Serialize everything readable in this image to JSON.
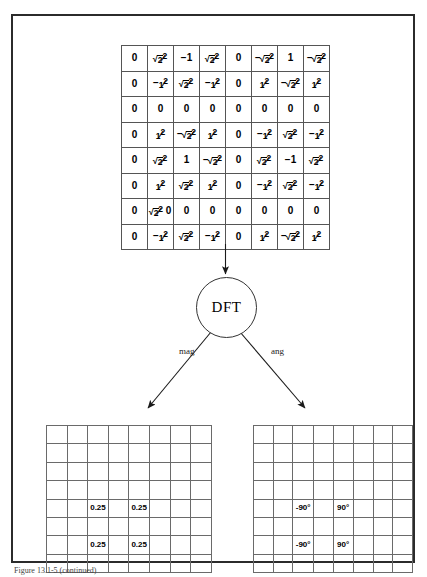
{
  "figure": {
    "caption": "Figure 13.1-5 (continued)",
    "transform_label": "DFT",
    "branch_labels": {
      "magnitude": "mag",
      "angle": "ang"
    }
  },
  "input_matrix": {
    "rows": 8,
    "cols": 8,
    "cells": [
      [
        "0",
        "√2/2",
        "-1",
        "√2/2",
        "0",
        "-√2/2",
        "1",
        "-√2/2"
      ],
      [
        "0",
        "-1/2",
        "√2/2",
        "-1/2",
        "0",
        "1/2",
        "-√2/2",
        "1/2"
      ],
      [
        "0",
        "0",
        "0",
        "0",
        "0",
        "0",
        "0",
        "0"
      ],
      [
        "0",
        "1/2",
        "-√2/2",
        "1/2",
        "0",
        "-1/2",
        "√2/2",
        "-1/2"
      ],
      [
        "0",
        "√2/2",
        "1",
        "-√2/2",
        "0",
        "√2/2",
        "-1",
        "√2/2"
      ],
      [
        "0",
        "1/2",
        "√2/2",
        "1/2",
        "0",
        "-1/2",
        "√2/2",
        "-1/2"
      ],
      [
        "0",
        "√2/2 0",
        "0",
        "0",
        "0",
        "0",
        "0",
        "0"
      ],
      [
        "0",
        "-1/2",
        "√2/2",
        "-1/2",
        "0",
        "1/2",
        "-√2/2",
        "1/2"
      ]
    ]
  },
  "chart_data": {
    "type": "heatmap",
    "grids": [
      {
        "name": "magnitude",
        "label": "mag",
        "rows": 8,
        "cols": 8,
        "values": [
          [
            "",
            "",
            "",
            "",
            "",
            "",
            "",
            ""
          ],
          [
            "",
            "",
            "",
            "",
            "",
            "",
            "",
            ""
          ],
          [
            "",
            "",
            "",
            "",
            "",
            "",
            "",
            ""
          ],
          [
            "",
            "",
            "",
            "",
            "",
            "",
            "",
            ""
          ],
          [
            "",
            "",
            "0.25",
            "",
            "0.25",
            "",
            "",
            ""
          ],
          [
            "",
            "",
            "",
            "",
            "",
            "",
            "",
            ""
          ],
          [
            "",
            "",
            "0.25",
            "",
            "0.25",
            "",
            "",
            ""
          ],
          [
            "",
            "",
            "",
            "",
            "",
            "",
            "",
            ""
          ]
        ]
      },
      {
        "name": "angle",
        "label": "ang",
        "rows": 8,
        "cols": 8,
        "values": [
          [
            "",
            "",
            "",
            "",
            "",
            "",
            "",
            ""
          ],
          [
            "",
            "",
            "",
            "",
            "",
            "",
            "",
            ""
          ],
          [
            "",
            "",
            "",
            "",
            "",
            "",
            "",
            ""
          ],
          [
            "",
            "",
            "",
            "",
            "",
            "",
            "",
            ""
          ],
          [
            "",
            "",
            "-90°",
            "",
            "90°",
            "",
            "",
            ""
          ],
          [
            "",
            "",
            "",
            "",
            "",
            "",
            "",
            ""
          ],
          [
            "",
            "",
            "-90°",
            "",
            "90°",
            "",
            "",
            ""
          ],
          [
            "",
            "",
            "",
            "",
            "",
            "",
            "",
            ""
          ]
        ]
      }
    ]
  },
  "colors": {
    "frame_border": "#2b2b2b",
    "grid_line": "#6a6a6a",
    "matrix_line": "#555555",
    "arrow": "#1a1a1a",
    "text": "#000000",
    "background": "#ffffff"
  }
}
